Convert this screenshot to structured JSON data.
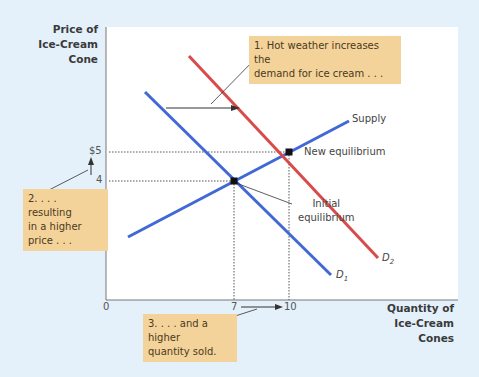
{
  "axes": {
    "y_title_lines": [
      "Price of",
      "Ice-Cream",
      "Cone"
    ],
    "x_title_lines": [
      "Quantity of",
      "Ice-Cream Cones"
    ],
    "y_ticks": [
      "$5",
      "4"
    ],
    "x_ticks": [
      "0",
      "7",
      "10"
    ]
  },
  "curves": {
    "supply": "Supply",
    "d1": "D",
    "d1_sub": "1",
    "d2": "D",
    "d2_sub": "2"
  },
  "equilibria": {
    "new": "New equilibrium",
    "initial_lines": [
      "Initial",
      "equilibrium"
    ],
    "initial_point": {
      "quantity": 7,
      "price": 4
    },
    "new_point": {
      "quantity": 10,
      "price": 5
    }
  },
  "callouts": {
    "step1_lines": [
      "1. Hot weather increases the",
      "demand for ice cream . . ."
    ],
    "step2_lines": [
      "2. . . . resulting",
      "in a higher",
      "price . . ."
    ],
    "step3_lines": [
      "3. . . . and a higher",
      "quantity sold."
    ]
  },
  "colors": {
    "supply": "#4169d6",
    "d1": "#4169d6",
    "d2": "#d94b4b",
    "callout_bg": "#f4d39a",
    "page_bg": "#e4f0fa"
  }
}
